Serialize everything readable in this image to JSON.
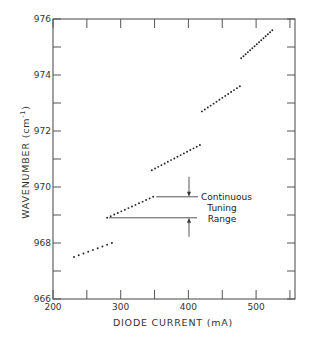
{
  "chart_data": {
    "type": "scatter",
    "title": "",
    "xlabel": "DIODE CURRENT (mA)",
    "ylabel": "WAVENUMBER (cm⁻¹)",
    "ylabel_base": "WAVENUMBER (cm",
    "ylabel_sup": "-1",
    "ylabel_end": ")",
    "xlim": [
      200,
      557
    ],
    "ylim": [
      966,
      976
    ],
    "x_ticks": [
      200,
      300,
      400,
      500
    ],
    "x_minor_ticks": [
      250,
      350,
      450,
      550
    ],
    "y_ticks": [
      966,
      968,
      970,
      972,
      974,
      976
    ],
    "y_minor_ticks": [
      967,
      969,
      971,
      973,
      975
    ],
    "grid": false,
    "legend": null,
    "series": [
      {
        "name": "mode 1",
        "start": [
          231,
          967.5
        ],
        "end": [
          287,
          968.0
        ],
        "points": 9
      },
      {
        "name": "mode 2",
        "start": [
          280,
          968.9
        ],
        "end": [
          348,
          969.65
        ],
        "points": 14
      },
      {
        "name": "mode 3",
        "start": [
          346,
          970.6
        ],
        "end": [
          417,
          971.5
        ],
        "points": 16
      },
      {
        "name": "mode 4",
        "start": [
          420,
          972.7
        ],
        "end": [
          476,
          973.6
        ],
        "points": 14
      },
      {
        "name": "mode 5",
        "start": [
          478,
          974.6
        ],
        "end": [
          524,
          975.6
        ],
        "points": 15
      }
    ],
    "annotations": [
      {
        "text_lines": [
          "Continuous",
          "Tuning",
          "Range"
        ],
        "upper_y": 969.65,
        "lower_y": 968.9,
        "arrow_x": 403
      }
    ]
  },
  "annotation": {
    "line1": "Continuous",
    "line2": "Tuning",
    "line3": "Range"
  }
}
